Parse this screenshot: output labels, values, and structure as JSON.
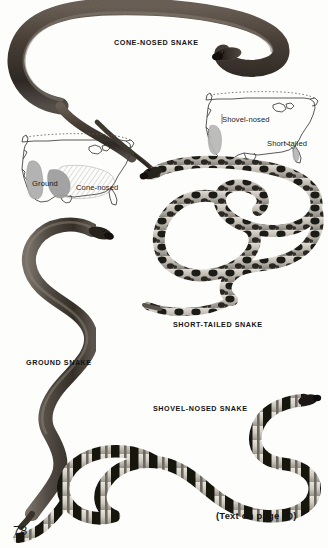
{
  "page": {
    "folio": "78",
    "text_reference": "(Text on page 80)",
    "background_color": "#fdfdfc",
    "plate_type": "natural-history illustration plate"
  },
  "captions": {
    "cone_nosed": "CONE-NOSED SNAKE",
    "ground": "GROUND SNAKE",
    "short_tailed": "SHORT-TAILED SNAKE",
    "shovel_nosed": "SHOVEL-NOSED SNAKE"
  },
  "maps": [
    {
      "id": "map-ground-cone-nosed",
      "region_labels": [
        "Ground",
        "Cone-nosed"
      ],
      "shading_colors": [
        "#b3b3b3",
        "#cfcfcf"
      ],
      "outline_color": "#3a3a3a",
      "title": "United States range map"
    },
    {
      "id": "map-shovel-short-tailed",
      "region_labels": [
        "Shovel-nosed",
        "Short-tailed"
      ],
      "shading_colors": [
        "#b3b3b3",
        "#b3b3b3"
      ],
      "outline_color": "#3a3a3a",
      "title": "United States range map"
    }
  ],
  "snakes": [
    {
      "id": "cone-nosed-snake",
      "name": "CONE-NOSED SNAKE",
      "body_color": "#4a4038",
      "pattern": "uniform dark brown, smooth glossy scales",
      "pose": "wide hairpin arc across top of plate, head at right, tapering tail to lower left"
    },
    {
      "id": "ground-snake",
      "name": "GROUND SNAKE",
      "body_color": "#55504a",
      "pattern": "uniform gray-brown, faint sheen",
      "pose": "long vertical S-curve, head upper right, tail to bottom"
    },
    {
      "id": "short-tailed-snake",
      "name": "SHORT-TAILED SNAKE",
      "body_color": "#d9d5cd",
      "blotch_color": "#1d1c1a",
      "pattern": "dark blotches on pale gray ground",
      "pose": "loosely coiled knot with tail trailing to lower left"
    },
    {
      "id": "shovel-nosed-snake",
      "name": "SHOVEL-NOSED SNAKE",
      "body_color": "#e2ded6",
      "band_color": "#161514",
      "pattern": "bold black saddles/bands on pale cream body",
      "pose": "serpentine double-S running from lower left to right"
    }
  ]
}
